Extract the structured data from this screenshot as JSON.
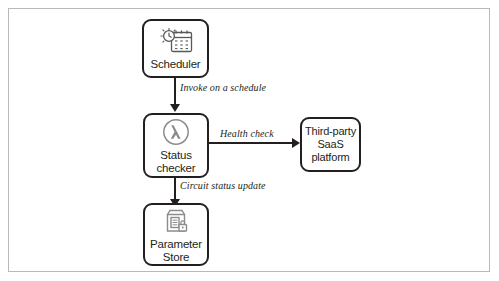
{
  "diagram": {
    "type": "flowchart",
    "title": "",
    "frame": {
      "border_color": "#b9b9b9",
      "background": "#ffffff"
    },
    "line_color": "#231f20",
    "nodes": [
      {
        "id": "scheduler",
        "label": "Scheduler",
        "icon": "clock-calendar-icon",
        "shape": "rounded-rect"
      },
      {
        "id": "status_checker",
        "label": "Status\nchecker",
        "icon": "lambda-function-icon",
        "shape": "rounded-rect"
      },
      {
        "id": "parameter_store",
        "label": "Parameter\nStore",
        "icon": "document-lock-icon",
        "shape": "rounded-rect"
      },
      {
        "id": "saas_platform",
        "label": "Third-party\nSaaS\nplatform",
        "icon": "none",
        "shape": "rounded-rect"
      }
    ],
    "edges": [
      {
        "id": "invoke",
        "from": "scheduler",
        "to": "status_checker",
        "label": "Invoke on a schedule",
        "direction": "down"
      },
      {
        "id": "health",
        "from": "status_checker",
        "to": "saas_platform",
        "label": "Health check",
        "direction": "right"
      },
      {
        "id": "circuit",
        "from": "status_checker",
        "to": "parameter_store",
        "label": "Circuit status update",
        "direction": "down"
      }
    ]
  }
}
